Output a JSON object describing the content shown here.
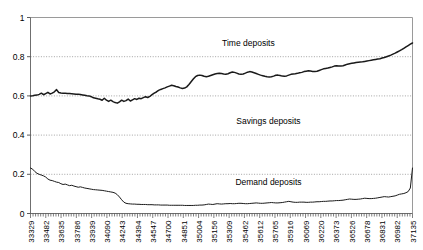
{
  "chart_data": {
    "type": "line",
    "title": "",
    "subtitle": "",
    "xlabel": "",
    "ylabel": "",
    "xlim": [
      33329,
      37135
    ],
    "ylim": [
      0,
      1
    ],
    "grid": true,
    "grid_style": "dotted-horizontal",
    "legend_position": "inline-annotations",
    "y_ticks": [
      "0",
      "0.2",
      "0.4",
      "0.6",
      "0.8",
      "1"
    ],
    "y_tick_values": [
      0,
      0.2,
      0.4,
      0.6,
      0.8,
      1
    ],
    "x_ticks": [
      "33329",
      "33482",
      "33635",
      "33786",
      "33939",
      "34090",
      "34243",
      "34394",
      "34547",
      "34700",
      "34851",
      "35004",
      "35156",
      "35309",
      "35462",
      "35612",
      "35765",
      "35916",
      "36069",
      "36220",
      "36373",
      "36526",
      "36678",
      "36831",
      "36982",
      "37135"
    ],
    "x_tick_values": [
      33329,
      33482,
      33635,
      33786,
      33939,
      34090,
      34243,
      34394,
      34547,
      34700,
      34851,
      35004,
      35156,
      35309,
      35462,
      35612,
      35765,
      35916,
      36069,
      36220,
      36373,
      36526,
      36678,
      36831,
      36982,
      37135
    ],
    "annotations": [
      {
        "text": "Time deposits",
        "x": 35500,
        "y": 0.855
      },
      {
        "text": "Savings deposits",
        "x": 35700,
        "y": 0.455
      },
      {
        "text": "Demand deposits",
        "x": 35700,
        "y": 0.145
      }
    ],
    "series": [
      {
        "name": "Time deposits",
        "color": "#1a1a1a",
        "values": [
          0.6,
          0.601,
          0.603,
          0.604,
          0.608,
          0.614,
          0.606,
          0.612,
          0.618,
          0.61,
          0.614,
          0.621,
          0.632,
          0.617,
          0.615,
          0.614,
          0.613,
          0.612,
          0.612,
          0.611,
          0.61,
          0.609,
          0.608,
          0.607,
          0.605,
          0.603,
          0.601,
          0.6,
          0.596,
          0.59,
          0.588,
          0.585,
          0.583,
          0.578,
          0.588,
          0.578,
          0.572,
          0.578,
          0.571,
          0.566,
          0.563,
          0.57,
          0.578,
          0.572,
          0.576,
          0.584,
          0.574,
          0.58,
          0.586,
          0.582,
          0.588,
          0.586,
          0.591,
          0.596,
          0.592,
          0.598,
          0.606,
          0.614,
          0.62,
          0.628,
          0.633,
          0.637,
          0.641,
          0.646,
          0.65,
          0.654,
          0.652,
          0.648,
          0.645,
          0.641,
          0.638,
          0.64,
          0.646,
          0.658,
          0.672,
          0.686,
          0.698,
          0.704,
          0.706,
          0.704,
          0.7,
          0.698,
          0.7,
          0.704,
          0.708,
          0.712,
          0.714,
          0.715,
          0.714,
          0.712,
          0.711,
          0.713,
          0.718,
          0.722,
          0.72,
          0.716,
          0.712,
          0.71,
          0.712,
          0.716,
          0.721,
          0.724,
          0.722,
          0.718,
          0.714,
          0.71,
          0.706,
          0.703,
          0.7,
          0.698,
          0.697,
          0.698,
          0.701,
          0.705,
          0.706,
          0.704,
          0.701,
          0.7,
          0.702,
          0.706,
          0.71,
          0.712,
          0.713,
          0.715,
          0.718,
          0.72,
          0.724,
          0.726,
          0.728,
          0.727,
          0.725,
          0.724,
          0.726,
          0.73,
          0.734,
          0.738,
          0.74,
          0.742,
          0.745,
          0.748,
          0.752,
          0.754,
          0.753,
          0.752,
          0.754,
          0.758,
          0.762,
          0.764,
          0.766,
          0.768,
          0.77,
          0.772,
          0.773,
          0.774,
          0.776,
          0.778,
          0.78,
          0.782,
          0.784,
          0.786,
          0.788,
          0.79,
          0.793,
          0.796,
          0.8,
          0.804,
          0.808,
          0.813,
          0.818,
          0.824,
          0.83,
          0.836,
          0.843,
          0.85,
          0.857,
          0.864,
          0.87
        ]
      },
      {
        "name": "Demand deposits",
        "color": "#1a1a1a",
        "values": [
          0.232,
          0.226,
          0.214,
          0.205,
          0.2,
          0.196,
          0.192,
          0.186,
          0.176,
          0.17,
          0.168,
          0.164,
          0.16,
          0.158,
          0.152,
          0.148,
          0.15,
          0.146,
          0.142,
          0.144,
          0.14,
          0.137,
          0.134,
          0.136,
          0.133,
          0.13,
          0.128,
          0.126,
          0.124,
          0.122,
          0.121,
          0.12,
          0.119,
          0.118,
          0.116,
          0.114,
          0.112,
          0.11,
          0.108,
          0.104,
          0.096,
          0.084,
          0.07,
          0.058,
          0.052,
          0.05,
          0.049,
          0.048,
          0.048,
          0.047,
          0.047,
          0.046,
          0.046,
          0.046,
          0.045,
          0.045,
          0.045,
          0.044,
          0.044,
          0.044,
          0.043,
          0.043,
          0.043,
          0.043,
          0.042,
          0.042,
          0.042,
          0.042,
          0.042,
          0.042,
          0.042,
          0.041,
          0.041,
          0.041,
          0.041,
          0.041,
          0.042,
          0.042,
          0.043,
          0.043,
          0.044,
          0.046,
          0.048,
          0.047,
          0.046,
          0.048,
          0.05,
          0.049,
          0.048,
          0.049,
          0.05,
          0.05,
          0.051,
          0.05,
          0.05,
          0.051,
          0.052,
          0.052,
          0.051,
          0.05,
          0.05,
          0.051,
          0.052,
          0.053,
          0.054,
          0.053,
          0.052,
          0.052,
          0.053,
          0.054,
          0.055,
          0.056,
          0.055,
          0.054,
          0.054,
          0.055,
          0.056,
          0.058,
          0.06,
          0.062,
          0.06,
          0.058,
          0.057,
          0.057,
          0.058,
          0.058,
          0.058,
          0.057,
          0.057,
          0.058,
          0.058,
          0.059,
          0.06,
          0.06,
          0.061,
          0.062,
          0.062,
          0.063,
          0.064,
          0.064,
          0.065,
          0.066,
          0.066,
          0.067,
          0.068,
          0.07,
          0.072,
          0.074,
          0.073,
          0.072,
          0.072,
          0.073,
          0.074,
          0.076,
          0.078,
          0.077,
          0.076,
          0.076,
          0.077,
          0.078,
          0.08,
          0.082,
          0.084,
          0.086,
          0.085,
          0.084,
          0.086,
          0.088,
          0.09,
          0.094,
          0.098,
          0.1,
          0.102,
          0.106,
          0.112,
          0.13,
          0.232
        ]
      }
    ]
  }
}
